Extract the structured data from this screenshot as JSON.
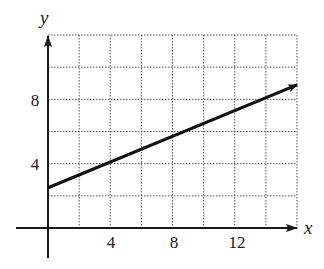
{
  "chart_data": {
    "type": "line",
    "title": "",
    "xlabel": "x",
    "ylabel": "y",
    "xlim": [
      0,
      16
    ],
    "ylim": [
      0,
      12
    ],
    "grid": true,
    "grid_step": 2,
    "x_ticks": [
      4,
      8,
      12
    ],
    "y_ticks": [
      4,
      8
    ],
    "x_tick_labels": [
      "4",
      "8",
      "12"
    ],
    "y_tick_labels": [
      "4",
      "8"
    ],
    "series": [
      {
        "name": "line",
        "x": [
          0,
          4,
          8,
          16
        ],
        "y": [
          2.5,
          4.1,
          5.7,
          8.9
        ],
        "arrow_end": true
      }
    ],
    "legend": null
  },
  "axes": {
    "x_name": "x",
    "y_name": "y",
    "x_ticks": [
      "4",
      "8",
      "12"
    ],
    "y_ticks": [
      "4",
      "8"
    ]
  },
  "colors": {
    "line": "#111111",
    "grid": "#555555",
    "background": "#ffffff"
  }
}
